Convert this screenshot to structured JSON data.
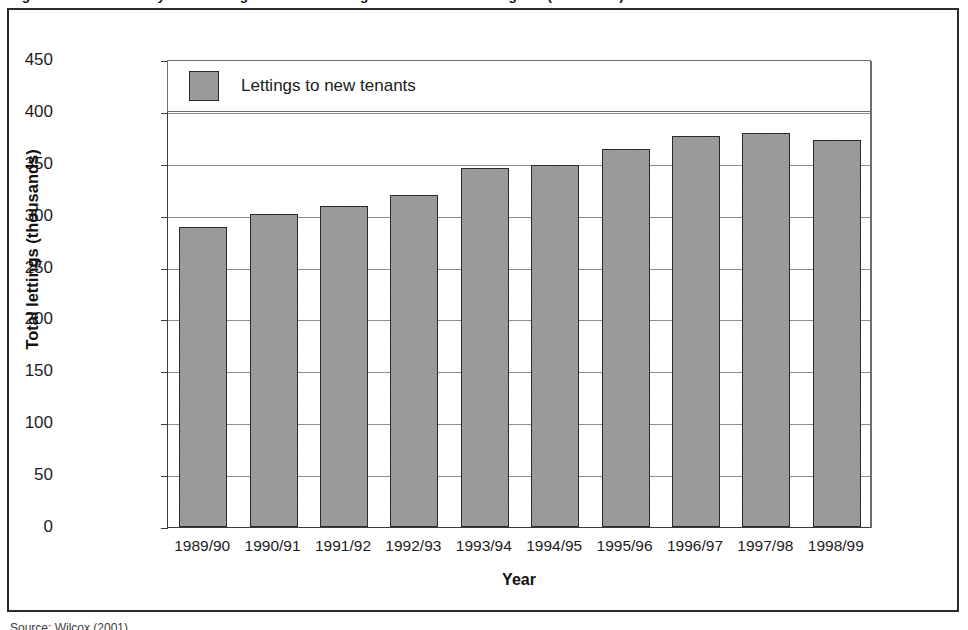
{
  "figure": {
    "title": "Figure 1: Local authority and housing association lettings to new tenants in England (thousands)",
    "source_note": "Source: Wilcox (2001)"
  },
  "legend": {
    "position": "top",
    "entries": [
      {
        "label": "Lettings to new tenants",
        "swatch_name": "legend-swatch-lettings",
        "color": "#8e8e8e"
      }
    ]
  },
  "axes": {
    "y": {
      "title": "Total lettings (thousands)",
      "ticks": [
        "450",
        "400",
        "350",
        "300",
        "250",
        "200",
        "150",
        "100",
        "50",
        "0"
      ],
      "min": 0,
      "max": 450,
      "step": 50
    },
    "x": {
      "title": "Year"
    }
  },
  "chart_data": {
    "type": "bar",
    "title": "Figure 1: Local authority and housing association lettings to new tenants in England (thousands)",
    "xlabel": "Year",
    "ylabel": "Total lettings (thousands)",
    "ylim": [
      0,
      450
    ],
    "ytick_step": 50,
    "grid": true,
    "legend_position": "top",
    "categories": [
      "1989/90",
      "1990/91",
      "1991/92",
      "1992/93",
      "1993/94",
      "1994/95",
      "1995/96",
      "1996/97",
      "1997/98",
      "1998/99"
    ],
    "series": [
      {
        "name": "Lettings to new tenants",
        "color": "#8e8e8e",
        "values": [
          289,
          302,
          309,
          320,
          346,
          349,
          364,
          377,
          380,
          373
        ]
      }
    ]
  },
  "colors": {
    "bar_fill": "#8e8e8e",
    "bar_border": "#2a2a2a",
    "frame": "#2b2b2b",
    "gridline": "#8c8c8c",
    "text": "#1c1c1c"
  }
}
